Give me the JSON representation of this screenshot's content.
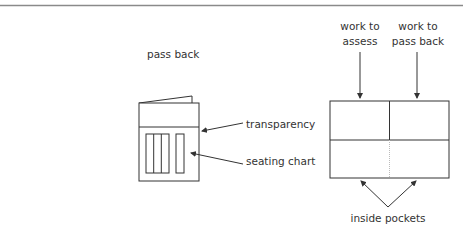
{
  "diagram": {
    "closed_folder": {
      "title": "pass back",
      "labels": {
        "transparency": "transparency",
        "seating_chart": "seating chart"
      }
    },
    "open_folder": {
      "left_pocket_label": [
        "work to",
        "assess"
      ],
      "right_pocket_label": [
        "work to",
        "pass back"
      ],
      "bottom_label": "inside pockets"
    },
    "colors": {
      "line": "#333333",
      "rule": "#8a8a8a",
      "dotted": "#bbbbbb"
    }
  }
}
